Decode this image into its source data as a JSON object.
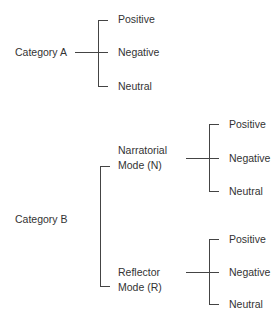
{
  "diagram": {
    "category_a": {
      "label": "Category A",
      "children": [
        "Positive",
        "Negative",
        "Neutral"
      ]
    },
    "category_b": {
      "label": "Category B",
      "modes": [
        {
          "line1": "Narratorial",
          "line2": "Mode (N)",
          "children": [
            "Positive",
            "Negative",
            "Neutral"
          ]
        },
        {
          "line1": "Reflector",
          "line2": "Mode (R)",
          "children": [
            "Positive",
            "Negative",
            "Neutral"
          ]
        }
      ]
    },
    "line_color": "#444444"
  }
}
